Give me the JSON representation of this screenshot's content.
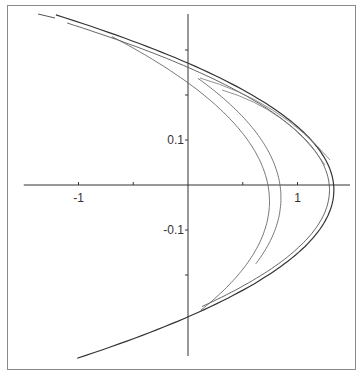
{
  "chart_data": {
    "type": "line",
    "title": "",
    "xlabel": "",
    "ylabel": "",
    "xlim": [
      -1.5,
      1.5
    ],
    "ylim": [
      -0.4,
      0.4
    ],
    "grid": false,
    "legend": null,
    "axes": {
      "origin_px": [
        188,
        185
      ],
      "x_px_per_unit": 109.5,
      "y_px_per_unit": 450,
      "x_ticks": [
        -1,
        -0.5,
        0,
        0.5,
        1
      ],
      "x_tick_labels": [
        {
          "value": -1,
          "label": "-1"
        },
        {
          "value": 1,
          "label": "1"
        }
      ],
      "y_ticks": [
        0.3,
        0.2,
        0.1,
        -0.1,
        -0.2
      ],
      "y_tick_labels": [
        {
          "value": 0.1,
          "label": "0.1"
        },
        {
          "value": -0.1,
          "label": "-0.1"
        }
      ],
      "x_axis_range": [
        -1.5,
        1.48
      ],
      "y_axis_range": [
        -0.38,
        0.38
      ]
    },
    "series": [
      {
        "name": "outer-band-1",
        "color": "#333333",
        "width": 1.2,
        "y_start": 0.378,
        "y_end": -0.385,
        "vertex_x": 1.33,
        "vertex_y": 0.0,
        "curv": 0.009066,
        "tilt": 0.0907
      },
      {
        "name": "outer-band-2",
        "color": "#555555",
        "width": 0.9,
        "y_start": 0.36,
        "y_end": -0.27,
        "vertex_x": 1.29,
        "vertex_y": 0.0,
        "curv": 0.0094,
        "tilt": 0.095
      },
      {
        "name": "inner-band-1",
        "color": "#666666",
        "width": 0.9,
        "y_start": 0.33,
        "y_end": -0.278,
        "vertex_x": 0.73,
        "vertex_y": 0.0,
        "curv": 0.0058,
        "tilt": 0.19
      },
      {
        "name": "inner-band-2",
        "color": "#666666",
        "width": 0.9,
        "y_start": 0.237,
        "y_end": -0.175,
        "vertex_x": 0.84,
        "vertex_y": 0.0,
        "curv": 0.0058,
        "tilt": 0.15
      }
    ],
    "folds": [
      {
        "name": "fold-1",
        "tip": [
          200,
          78
        ],
        "upper_join": [
          330,
          160
        ],
        "lower_join": [
          334,
          185
        ]
      },
      {
        "name": "fold-2",
        "tip": [
          222,
          90
        ],
        "upper_join": [
          325,
          165
        ],
        "lower_join": [
          330,
          185
        ]
      }
    ]
  }
}
